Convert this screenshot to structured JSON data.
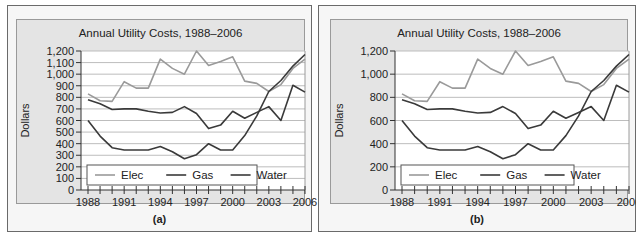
{
  "chart_data": [
    {
      "type": "line",
      "panel_label": "(a)",
      "title": "Annual Utility Costs, 1988–2006",
      "xlabel": "",
      "ylabel": "Dollars",
      "ylim": [
        0,
        1200
      ],
      "yticks": [
        0,
        100,
        200,
        300,
        400,
        500,
        600,
        700,
        800,
        900,
        1000,
        1100,
        1200
      ],
      "ytick_labels": [
        "0",
        "100",
        "200",
        "300",
        "400",
        "500",
        "600",
        "700",
        "800",
        "900",
        "1,000",
        "1,100",
        "1,200"
      ],
      "xticks_labeled": [
        "1988",
        "1991",
        "1994",
        "1997",
        "2000",
        "2003",
        "2006"
      ],
      "x": [
        1988,
        1989,
        1990,
        1991,
        1992,
        1993,
        1994,
        1995,
        1996,
        1997,
        1998,
        1999,
        2000,
        2001,
        2002,
        2003,
        2004,
        2005,
        2006
      ],
      "grid": true,
      "legend_position": "inside lower left",
      "series": [
        {
          "name": "Elec",
          "color": "#9a9a9a",
          "values": [
            830,
            770,
            765,
            935,
            880,
            880,
            1130,
            1050,
            1000,
            1200,
            1075,
            1110,
            1150,
            940,
            920,
            850,
            910,
            1050,
            1130
          ]
        },
        {
          "name": "Gas",
          "color": "#3a3a3a",
          "values": [
            780,
            745,
            695,
            700,
            700,
            680,
            665,
            670,
            720,
            660,
            530,
            560,
            680,
            620,
            670,
            720,
            600,
            905,
            845
          ]
        },
        {
          "name": "Water",
          "color": "#3a3a3a",
          "values": [
            600,
            465,
            365,
            345,
            345,
            345,
            375,
            330,
            270,
            305,
            400,
            345,
            345,
            470,
            640,
            850,
            945,
            1070,
            1170
          ]
        }
      ]
    },
    {
      "type": "line",
      "panel_label": "(b)",
      "title": "Annual Utility Costs, 1988–2006",
      "xlabel": "",
      "ylabel": "Dollars",
      "ylim": [
        0,
        1200
      ],
      "yticks": [
        0,
        200,
        400,
        600,
        800,
        1000,
        1200
      ],
      "ytick_labels": [
        "0",
        "200",
        "400",
        "600",
        "800",
        "1,000",
        "1,200"
      ],
      "xticks_labeled": [
        "1988",
        "1991",
        "1994",
        "1997",
        "2000",
        "2003",
        "2006"
      ],
      "x": [
        1988,
        1989,
        1990,
        1991,
        1992,
        1993,
        1994,
        1995,
        1996,
        1997,
        1998,
        1999,
        2000,
        2001,
        2002,
        2003,
        2004,
        2005,
        2006
      ],
      "grid": true,
      "legend_position": "inside lower left",
      "series": [
        {
          "name": "Elec",
          "color": "#9a9a9a",
          "values": [
            830,
            770,
            765,
            935,
            880,
            880,
            1130,
            1050,
            1000,
            1200,
            1075,
            1110,
            1150,
            940,
            920,
            850,
            910,
            1050,
            1130
          ]
        },
        {
          "name": "Gas",
          "color": "#3a3a3a",
          "values": [
            780,
            745,
            695,
            700,
            700,
            680,
            665,
            670,
            720,
            660,
            530,
            560,
            680,
            620,
            670,
            720,
            600,
            905,
            845
          ]
        },
        {
          "name": "Water",
          "color": "#3a3a3a",
          "values": [
            600,
            465,
            365,
            345,
            345,
            345,
            375,
            330,
            270,
            305,
            400,
            345,
            345,
            470,
            640,
            850,
            945,
            1070,
            1170
          ]
        }
      ]
    }
  ]
}
